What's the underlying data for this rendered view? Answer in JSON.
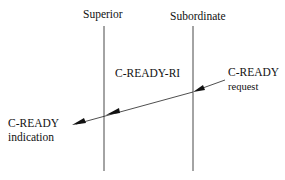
{
  "diagram": {
    "lifelines": [
      {
        "label": "Superior"
      },
      {
        "label": "Subordinate"
      }
    ],
    "message": {
      "name": "C-READY-RI",
      "source_primitive": {
        "line1": "C-READY",
        "line2": "request"
      },
      "target_primitive": {
        "line1": "C-READY",
        "line2": "indication"
      }
    },
    "colors": {
      "line": "#111111",
      "background": "#ffffff"
    }
  }
}
